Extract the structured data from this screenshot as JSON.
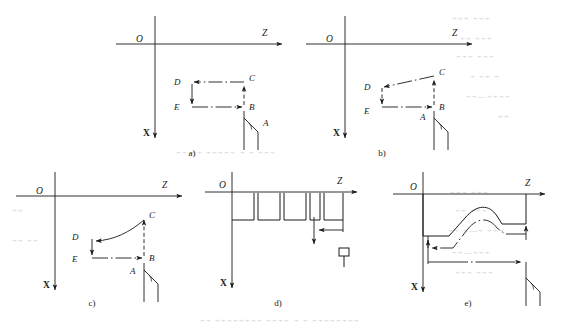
{
  "figure": {
    "axes": {
      "horizontal": "Z",
      "vertical": "X",
      "origin": "O"
    },
    "stroke_color": "#1a1a1a",
    "background_color": "#ffffff"
  },
  "panels": [
    {
      "id": "a",
      "caption": "a)",
      "description": "Rectangular rough turning cycle, straight cut",
      "points": [
        "A",
        "B",
        "C",
        "D",
        "E"
      ],
      "axis_z": "Z",
      "axis_x": "X",
      "origin": "O",
      "path_type": "rectangular"
    },
    {
      "id": "b",
      "caption": "b)",
      "description": "Taper turning cycle, angled cut from C to D",
      "points": [
        "A",
        "B",
        "C",
        "D",
        "E"
      ],
      "axis_z": "Z",
      "axis_x": "X",
      "origin": "O",
      "path_type": "taper"
    },
    {
      "id": "c",
      "caption": "c)",
      "description": "Arc turning cycle, concave curved cut from C to D",
      "points": [
        "A",
        "B",
        "C",
        "D",
        "E"
      ],
      "axis_z": "Z",
      "axis_x": "X",
      "origin": "O",
      "path_type": "arc"
    },
    {
      "id": "d",
      "caption": "d)",
      "description": "Multiple grooving cycle with repeated slots",
      "points": [],
      "axis_z": "Z",
      "axis_x": "X",
      "origin": "O",
      "path_type": "grooving",
      "groove_count": 4
    },
    {
      "id": "e",
      "caption": "e)",
      "description": "Contour finishing cycle following a stepped curved profile",
      "points": [],
      "axis_z": "Z",
      "axis_x": "X",
      "origin": "O",
      "path_type": "contour"
    }
  ]
}
